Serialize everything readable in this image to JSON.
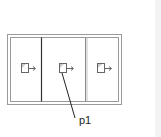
{
  "diagram": {
    "type": "panel-layout",
    "panels": [
      {
        "id": "left",
        "icon": "window-arrow-icon"
      },
      {
        "id": "center",
        "icon": "window-arrow-icon"
      },
      {
        "id": "right",
        "icon": "window-arrow-icon"
      }
    ],
    "labels": [
      {
        "text": "p1",
        "points_to": "center"
      }
    ],
    "colors": {
      "frame": "#9a9a9a",
      "divider_dark": "#333333",
      "divider_gray": "#8a8a8a",
      "icon_stroke": "#666666",
      "leader": "#222222"
    }
  }
}
